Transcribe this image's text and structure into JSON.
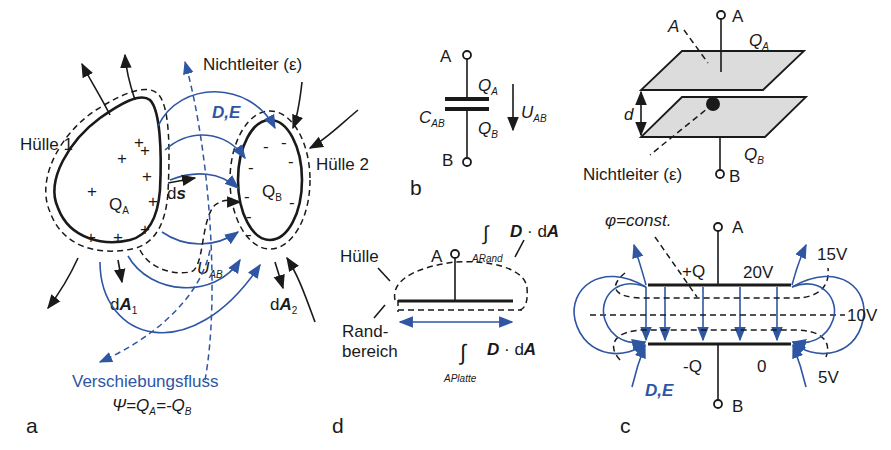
{
  "figure": {
    "colors": {
      "ink": "#1a1a1a",
      "accent_blue": "#2f56a3",
      "plate_gray": "#dcdcdc"
    },
    "panel_a": {
      "label": "a",
      "huelle1": "Hülle 1",
      "huelle2": "Hülle 2",
      "nichtleiter": "Nichtleiter (ε)",
      "field": "D,E",
      "charge_a": "Q",
      "charge_a_sub": "A",
      "charge_b": "Q",
      "charge_b_sub": "B",
      "ds": "d",
      "ds_bold": "s",
      "voltage": "U",
      "voltage_sub": "AB",
      "dA1": "d",
      "dA1_bold": "A",
      "dA1_sub": "1",
      "dA2": "d",
      "dA2_bold": "A",
      "dA2_sub": "2",
      "flux_title": "Verschiebungsfluss",
      "flux_eq_psi": "Ψ=Q",
      "flux_eq_sub1": "A",
      "flux_eq_mid": "=-Q",
      "flux_eq_sub2": "B",
      "plus_sign": "+",
      "minus_sign": "-"
    },
    "panel_b": {
      "label": "b",
      "terminal_a": "A",
      "terminal_b": "B",
      "charge_a": "Q",
      "charge_a_sub": "A",
      "charge_b": "Q",
      "charge_b_sub": "B",
      "cap": "C",
      "cap_sub": "AB",
      "voltage": "U",
      "voltage_sub": "AB"
    },
    "panel_plate": {
      "terminal_a": "A",
      "terminal_b": "B",
      "area": "A",
      "charge_a": "Q",
      "charge_a_sub": "A",
      "charge_b": "Q",
      "charge_b_sub": "B",
      "distance": "d",
      "nichtleiter": "Nichtleiter (ε)"
    },
    "panel_d": {
      "label": "d",
      "huelle": "Hülle",
      "rand1": "Rand-",
      "rand2": "bereich",
      "terminal_a": "A",
      "integral": "∫",
      "int_rand_sub": "A",
      "int_rand_sub2": "Rand",
      "int_platte_sub": "A",
      "int_platte_sub2": "Platte",
      "integrand_D": "D",
      "integrand_dot": " · d",
      "integrand_A": "A"
    },
    "panel_c": {
      "label": "c",
      "terminal_a": "A",
      "terminal_b": "B",
      "phi": "φ=const.",
      "plus_q": "+Q",
      "minus_q": "-Q",
      "v20": "20V",
      "v15": "15V",
      "v10": "10V",
      "v5": "5V",
      "v0": "0",
      "field": "D,E"
    }
  }
}
